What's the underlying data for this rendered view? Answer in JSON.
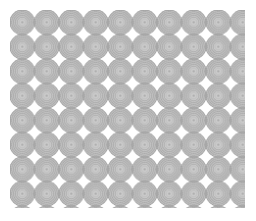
{
  "image": {
    "kind": "decorative-repeating-pattern",
    "title": "Concentric Circle Grid Pattern",
    "width": 256,
    "height": 221,
    "background_color": "#ffffff"
  },
  "pattern": {
    "motif_name": "concentric-ring-disc",
    "arrangement": "square-grid-tangent",
    "cell_size": 24.5,
    "circle_radius": 12.4,
    "origin_x": 10.0,
    "origin_y": 10.0,
    "columns": 10,
    "rows": 8,
    "clip_left": 10,
    "clip_top": 10,
    "clip_right": 245,
    "clip_bottom": 208,
    "top_row_clipped": true,
    "negative_space_shape": "concave-square",
    "negative_space_color": "#ffffff"
  },
  "colors": {
    "disc_fill": "#b0b0b0",
    "disc_fill_light": "#c2c2c2",
    "ring_stroke": "#9a9a9a",
    "ring_stroke_light": "#bdbdbd",
    "core_fill": "#d8d8d8",
    "center_dot": "#a8a8a8",
    "outline": "#a0a0a0",
    "background": "#ffffff"
  },
  "motif": {
    "ring_count": 6,
    "ring_radii": [
      12.4,
      10.6,
      8.8,
      7.0,
      5.0,
      3.0
    ],
    "center_dot_radius": 1.2,
    "scallop_count": 40
  },
  "labels": {
    "alt_text": "Seamless light gray pattern of tangent concentric circles on a white field"
  }
}
